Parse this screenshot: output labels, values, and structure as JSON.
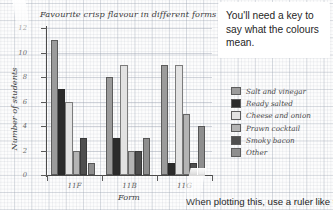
{
  "chart_data": {
    "type": "bar",
    "title": "Favourite crisp flavour in different forms",
    "xlabel": "Form",
    "ylabel": "Number of students",
    "categories": [
      "11F",
      "11B",
      "11G"
    ],
    "ylim": [
      0,
      12
    ],
    "yticks": [
      "0",
      "2",
      "4",
      "6",
      "8",
      "10",
      "12"
    ],
    "grid": true,
    "legend_position": "right",
    "series": [
      {
        "name": "Salt and vinegar",
        "color": "#9b9b9b",
        "values": [
          11,
          8,
          9
        ]
      },
      {
        "name": "Ready salted",
        "color": "#2b2b2b",
        "values": [
          7,
          3,
          1
        ]
      },
      {
        "name": "Cheese and onion",
        "color": "#e2e2e2",
        "values": [
          6,
          9,
          9
        ]
      },
      {
        "name": "Prawn cocktail",
        "color": "#b4b4b4",
        "values": [
          2,
          2,
          5
        ]
      },
      {
        "name": "Smoky bacon",
        "color": "#4f4f4f",
        "values": [
          3,
          2,
          1
        ]
      },
      {
        "name": "Other",
        "color": "#8e8e8e",
        "values": [
          1,
          3,
          4
        ]
      }
    ]
  },
  "callout": {
    "text": "You'll need a key to say what the colours mean."
  },
  "bottom_note": {
    "text": "When plotting this, use a ruler like thi"
  }
}
